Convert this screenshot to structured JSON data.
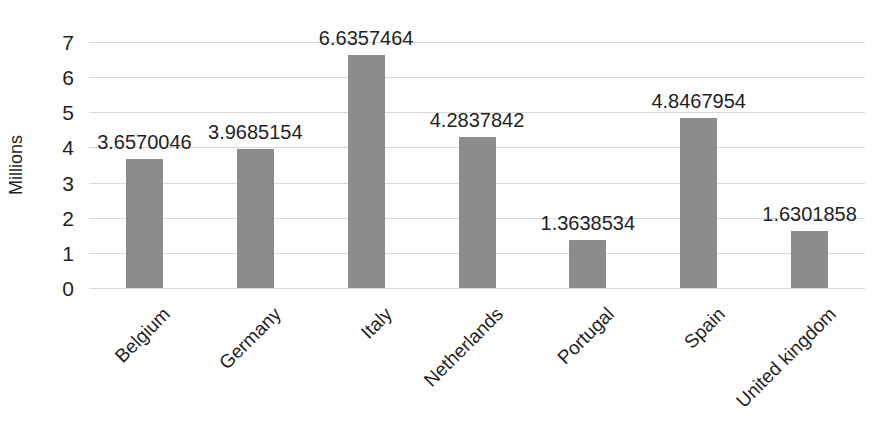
{
  "chart_data": {
    "type": "bar",
    "title": "",
    "xlabel": "",
    "ylabel": "Millions",
    "categories": [
      "Belgium",
      "Germany",
      "Italy",
      "Netherlands",
      "Portugal",
      "Spain",
      "United kingdom"
    ],
    "values": [
      3.6570046,
      3.9685154,
      6.6357464,
      4.2837842,
      1.3638534,
      4.8467954,
      1.6301858
    ],
    "data_labels": [
      "3.6570046",
      "3.9685154",
      "6.6357464",
      "4.2837842",
      "1.3638534",
      "4.8467954",
      "1.6301858"
    ],
    "ylim": [
      0,
      7
    ],
    "yticks": [
      0,
      1,
      2,
      3,
      4,
      5,
      6,
      7
    ],
    "ytick_labels": [
      "0",
      "1",
      "2",
      "3",
      "4",
      "5",
      "6",
      "7"
    ],
    "grid": true,
    "grid_axis": "y",
    "legend": false,
    "legend_position": "none",
    "series": [
      {
        "name": "",
        "values": [
          3.6570046,
          3.9685154,
          6.6357464,
          4.2837842,
          1.3638534,
          4.8467954,
          1.6301858
        ]
      }
    ],
    "colors": {
      "bar": "#8c8c8c",
      "gridline": "#d9d9d9",
      "text": "#1f1f1f",
      "background": "#ffffff"
    }
  }
}
